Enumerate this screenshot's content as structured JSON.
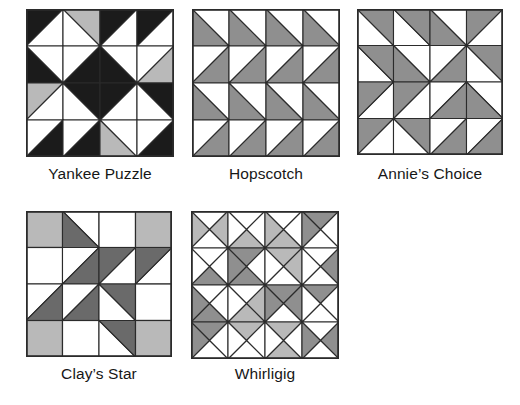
{
  "figure": {
    "name": "quilt-block-patterns",
    "background": "#ffffff",
    "palette": {
      "white": "#ffffff",
      "light_gray": "#b9b9b9",
      "mid_gray": "#8f8f8f",
      "dark_gray": "#6a6a6a",
      "black": "#1b1b1b",
      "outline": "#2b2b2b",
      "label_color": "#171717"
    },
    "grid": {
      "columns": 3,
      "rows": 2,
      "cell_px": 140
    }
  },
  "blocks": [
    {
      "id": "yankee-puzzle",
      "label": "Yankee Puzzle",
      "x": 26,
      "y": 9,
      "size": 148,
      "divisions": 4,
      "label_x": 26,
      "label_y": 166,
      "label_width": 148,
      "cell_type": "half-square",
      "cells": [
        [
          {
            "dir": "tl",
            "fill": "black",
            "other": "white"
          },
          {
            "dir": "tr",
            "fill": "light_gray",
            "other": "white"
          },
          {
            "dir": "tl",
            "fill": "black",
            "other": "white"
          },
          {
            "dir": "tl",
            "fill": "black",
            "other": "white"
          }
        ],
        [
          {
            "dir": "bl",
            "fill": "black",
            "other": "white"
          },
          {
            "dir": "br",
            "fill": "black",
            "other": "white"
          },
          {
            "dir": "bl",
            "fill": "black",
            "other": "white"
          },
          {
            "dir": "br",
            "fill": "light_gray",
            "other": "white"
          }
        ],
        [
          {
            "dir": "tl",
            "fill": "light_gray",
            "other": "white"
          },
          {
            "dir": "tr",
            "fill": "black",
            "other": "white"
          },
          {
            "dir": "tl",
            "fill": "black",
            "other": "white"
          },
          {
            "dir": "tr",
            "fill": "black",
            "other": "white"
          }
        ],
        [
          {
            "dir": "br",
            "fill": "black",
            "other": "white"
          },
          {
            "dir": "br",
            "fill": "black",
            "other": "white"
          },
          {
            "dir": "bl",
            "fill": "light_gray",
            "other": "white"
          },
          {
            "dir": "br",
            "fill": "black",
            "other": "white"
          }
        ]
      ]
    },
    {
      "id": "hopscotch",
      "label": "Hopscotch",
      "x": 192,
      "y": 9,
      "size": 148,
      "divisions": 4,
      "label_x": 192,
      "label_y": 166,
      "label_width": 148,
      "cell_type": "half-square",
      "cells": [
        [
          {
            "dir": "bl",
            "fill": "mid_gray",
            "other": "white"
          },
          {
            "dir": "bl",
            "fill": "mid_gray",
            "other": "white"
          },
          {
            "dir": "bl",
            "fill": "mid_gray",
            "other": "white"
          },
          {
            "dir": "bl",
            "fill": "mid_gray",
            "other": "white"
          }
        ],
        [
          {
            "dir": "br",
            "fill": "mid_gray",
            "other": "white"
          },
          {
            "dir": "br",
            "fill": "mid_gray",
            "other": "white"
          },
          {
            "dir": "br",
            "fill": "mid_gray",
            "other": "white"
          },
          {
            "dir": "br",
            "fill": "mid_gray",
            "other": "white"
          }
        ],
        [
          {
            "dir": "bl",
            "fill": "mid_gray",
            "other": "white"
          },
          {
            "dir": "bl",
            "fill": "mid_gray",
            "other": "white"
          },
          {
            "dir": "bl",
            "fill": "mid_gray",
            "other": "white"
          },
          {
            "dir": "bl",
            "fill": "mid_gray",
            "other": "white"
          }
        ],
        [
          {
            "dir": "br",
            "fill": "mid_gray",
            "other": "white"
          },
          {
            "dir": "br",
            "fill": "mid_gray",
            "other": "white"
          },
          {
            "dir": "br",
            "fill": "mid_gray",
            "other": "white"
          },
          {
            "dir": "br",
            "fill": "mid_gray",
            "other": "white"
          }
        ]
      ]
    },
    {
      "id": "annies-choice",
      "label": "Annie’s Choice",
      "x": 357,
      "y": 9,
      "size": 146,
      "divisions": 4,
      "label_x": 352,
      "label_y": 166,
      "label_width": 156,
      "cell_type": "half-square",
      "cells": [
        [
          {
            "dir": "tr",
            "fill": "mid_gray",
            "other": "white"
          },
          {
            "dir": "tr",
            "fill": "mid_gray",
            "other": "white"
          },
          {
            "dir": "bl",
            "fill": "mid_gray",
            "other": "white"
          },
          {
            "dir": "tl",
            "fill": "mid_gray",
            "other": "white"
          }
        ],
        [
          {
            "dir": "tr",
            "fill": "mid_gray",
            "other": "white"
          },
          {
            "dir": "bl",
            "fill": "mid_gray",
            "other": "white"
          },
          {
            "dir": "br",
            "fill": "mid_gray",
            "other": "white"
          },
          {
            "dir": "tr",
            "fill": "mid_gray",
            "other": "white"
          }
        ],
        [
          {
            "dir": "tl",
            "fill": "mid_gray",
            "other": "white"
          },
          {
            "dir": "tl",
            "fill": "mid_gray",
            "other": "white"
          },
          {
            "dir": "br",
            "fill": "mid_gray",
            "other": "white"
          },
          {
            "dir": "bl",
            "fill": "mid_gray",
            "other": "white"
          }
        ],
        [
          {
            "dir": "tl",
            "fill": "mid_gray",
            "other": "white"
          },
          {
            "dir": "tr",
            "fill": "mid_gray",
            "other": "white"
          },
          {
            "dir": "br",
            "fill": "mid_gray",
            "other": "white"
          },
          {
            "dir": "br",
            "fill": "mid_gray",
            "other": "white"
          }
        ]
      ]
    },
    {
      "id": "clays-star",
      "label": "Clay’s Star",
      "x": 26,
      "y": 211,
      "size": 146,
      "divisions": 4,
      "label_x": 24,
      "label_y": 366,
      "label_width": 150,
      "cell_type": "half-square",
      "cells": [
        [
          {
            "dir": "full",
            "fill": "light_gray",
            "other": "light_gray"
          },
          {
            "dir": "bl",
            "fill": "dark_gray",
            "other": "white"
          },
          {
            "dir": "none",
            "fill": "white",
            "other": "white"
          },
          {
            "dir": "full",
            "fill": "light_gray",
            "other": "light_gray"
          }
        ],
        [
          {
            "dir": "none",
            "fill": "white",
            "other": "white"
          },
          {
            "dir": "br",
            "fill": "dark_gray",
            "other": "white"
          },
          {
            "dir": "tl",
            "fill": "dark_gray",
            "other": "white"
          },
          {
            "dir": "tl",
            "fill": "dark_gray",
            "other": "white"
          }
        ],
        [
          {
            "dir": "br",
            "fill": "dark_gray",
            "other": "white"
          },
          {
            "dir": "br",
            "fill": "dark_gray",
            "other": "white"
          },
          {
            "dir": "tr",
            "fill": "dark_gray",
            "other": "white"
          },
          {
            "dir": "none",
            "fill": "white",
            "other": "white"
          }
        ],
        [
          {
            "dir": "full",
            "fill": "light_gray",
            "other": "light_gray"
          },
          {
            "dir": "none",
            "fill": "white",
            "other": "white"
          },
          {
            "dir": "tr",
            "fill": "dark_gray",
            "other": "white"
          },
          {
            "dir": "full",
            "fill": "light_gray",
            "other": "light_gray"
          }
        ]
      ]
    },
    {
      "id": "whirligig",
      "label": "Whirligig",
      "x": 191,
      "y": 211,
      "size": 148,
      "divisions": 4,
      "label_x": 191,
      "label_y": 366,
      "label_width": 148,
      "cell_type": "quarter-square",
      "cells": [
        [
          {
            "top": "white",
            "right": "light_gray",
            "bottom": "white",
            "left": "light_gray"
          },
          {
            "top": "white",
            "right": "white",
            "bottom": "light_gray",
            "left": "white"
          },
          {
            "top": "white",
            "right": "white",
            "bottom": "light_gray",
            "left": "light_gray"
          },
          {
            "top": "mid_gray",
            "right": "white",
            "bottom": "white",
            "left": "mid_gray"
          }
        ],
        [
          {
            "top": "white",
            "right": "white",
            "bottom": "mid_gray",
            "left": "white"
          },
          {
            "top": "mid_gray",
            "right": "white",
            "bottom": "mid_gray",
            "left": "mid_gray"
          },
          {
            "top": "light_gray",
            "right": "light_gray",
            "bottom": "white",
            "left": "white"
          },
          {
            "top": "white",
            "right": "mid_gray",
            "bottom": "white",
            "left": "white"
          }
        ],
        [
          {
            "top": "white",
            "right": "white",
            "bottom": "mid_gray",
            "left": "mid_gray"
          },
          {
            "top": "white",
            "right": "light_gray",
            "bottom": "light_gray",
            "left": "white"
          },
          {
            "top": "mid_gray",
            "right": "mid_gray",
            "bottom": "white",
            "left": "mid_gray"
          },
          {
            "top": "mid_gray",
            "right": "white",
            "bottom": "white",
            "left": "white"
          }
        ],
        [
          {
            "top": "mid_gray",
            "right": "white",
            "bottom": "white",
            "left": "mid_gray"
          },
          {
            "top": "light_gray",
            "right": "white",
            "bottom": "white",
            "left": "white"
          },
          {
            "top": "light_gray",
            "right": "white",
            "bottom": "light_gray",
            "left": "white"
          },
          {
            "top": "white",
            "right": "mid_gray",
            "bottom": "white",
            "left": "mid_gray"
          }
        ]
      ]
    }
  ]
}
